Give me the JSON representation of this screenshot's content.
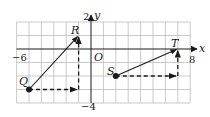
{
  "figure": {
    "axes": {
      "x_label": "x",
      "y_label": "y",
      "origin_label": "O",
      "x_min_label": "−6",
      "x_max_label": "8",
      "y_max_label": "2",
      "y_min_label": "−4",
      "x_range": [
        -6,
        8
      ],
      "y_range": [
        -4,
        2
      ]
    },
    "points": [
      {
        "name": "Q",
        "x": -5,
        "y": -3
      },
      {
        "name": "R",
        "x": -1,
        "y": 1
      },
      {
        "name": "S",
        "x": 2,
        "y": -2
      },
      {
        "name": "T",
        "x": 7,
        "y": 0
      }
    ],
    "vectors": [
      {
        "from": "Q",
        "to": "R",
        "style": "solid"
      },
      {
        "from": "S",
        "to": "T",
        "style": "solid"
      }
    ],
    "components": [
      {
        "from": [
          -5,
          -3
        ],
        "to": [
          -1,
          -3
        ],
        "style": "dashed"
      },
      {
        "from": [
          -1,
          -3
        ],
        "to": [
          -1,
          1
        ],
        "style": "dashed"
      },
      {
        "from": [
          2,
          -2
        ],
        "to": [
          7,
          -2
        ],
        "style": "dashed"
      },
      {
        "from": [
          7,
          -2
        ],
        "to": [
          7,
          0
        ],
        "style": "dashed"
      }
    ],
    "colors": {
      "grid": "#bdbdbd",
      "ink": "#1a1a1a",
      "background": "#ffffff"
    }
  }
}
